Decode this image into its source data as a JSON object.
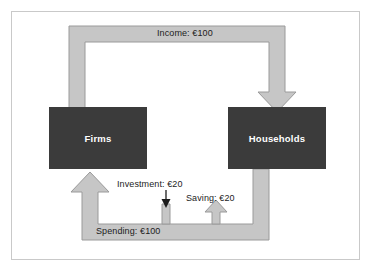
{
  "diagram": {
    "colors": {
      "node_fill": "#3b3b3b",
      "node_text": "#ffffff",
      "flow_band": "#c6c6c6",
      "flow_band_stroke": "#9a9a9a",
      "border": "#c9c9c9",
      "background": "#ffffff",
      "arrow_black": "#1c1c1c"
    },
    "nodes": [
      {
        "id": "firms",
        "label": "Firms"
      },
      {
        "id": "households",
        "label": "Households"
      }
    ],
    "flows": [
      {
        "id": "income",
        "label": "Income: €100",
        "amount": 100,
        "currency": "€",
        "from": "firms",
        "to": "households",
        "style": "band"
      },
      {
        "id": "spending",
        "label": "Spending: €100",
        "amount": 100,
        "currency": "€",
        "from": "households",
        "to": "firms",
        "style": "band"
      },
      {
        "id": "saving",
        "label": "Saving: €20",
        "amount": 20,
        "currency": "€",
        "from": "households",
        "to": "leakage",
        "style": "band-up"
      },
      {
        "id": "investment",
        "label": "Investment: €20",
        "amount": 20,
        "currency": "€",
        "from": "injection",
        "to": "spending",
        "style": "thin-arrow"
      }
    ]
  }
}
